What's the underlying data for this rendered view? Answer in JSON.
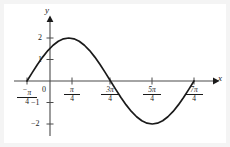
{
  "chart_data": {
    "type": "line",
    "title": "",
    "xlabel": "x",
    "ylabel": "y",
    "grid": false,
    "legend": null,
    "function": "y = 2 sin(x + pi/4)",
    "xlim": [
      -1.1781,
      6.0214
    ],
    "ylim": [
      -2.6,
      2.6
    ],
    "x_tick_labels": [
      "-π/4",
      "π/4",
      "3π/4",
      "5π/4",
      "7π/4"
    ],
    "x_tick_values": [
      -0.7854,
      0.7854,
      2.3562,
      3.927,
      5.4978
    ],
    "y_tick_labels": [
      "2",
      "1",
      "-1",
      "-2"
    ],
    "y_tick_values": [
      2,
      1,
      -1,
      -2
    ],
    "origin_label": "0",
    "x_points": [
      -0.7854,
      -0.589,
      -0.3927,
      -0.1963,
      0,
      0.1963,
      0.3927,
      0.589,
      0.7854,
      0.9817,
      1.1781,
      1.3744,
      1.5708,
      1.7671,
      1.9635,
      2.1598,
      2.3562,
      2.5525,
      2.7489,
      2.9452,
      3.1416,
      3.3379,
      3.5343,
      3.7306,
      3.927,
      4.1233,
      4.3197,
      4.516,
      4.7124,
      4.9087,
      5.1051,
      5.3014,
      5.4978
    ],
    "y_points": [
      0,
      0.3902,
      0.7654,
      1.1111,
      1.4142,
      1.6629,
      1.8478,
      1.9616,
      2,
      1.9616,
      1.8478,
      1.6629,
      1.4142,
      1.1111,
      0.7654,
      0.3902,
      0,
      -0.3902,
      -0.7654,
      -1.1111,
      -1.4142,
      -1.6629,
      -1.8478,
      -1.9616,
      -2,
      -1.9616,
      -1.8478,
      -1.6629,
      -1.4142,
      -1.1111,
      -0.7654,
      -0.3902,
      0
    ],
    "peak": {
      "x": 0.7854,
      "y": 2
    },
    "trough": {
      "x": 3.927,
      "y": -2
    },
    "zero_crossings": [
      -0.7854,
      2.3562,
      5.4978
    ],
    "curve_color": "#1a1a1a",
    "axis_color": "#4a4a4a",
    "background": "#f4f4f4"
  },
  "axes": {
    "y_name": "y",
    "x_name": "x"
  },
  "labels": {
    "y2": "2",
    "y1": "1",
    "ym1": "1",
    "ym2": "2",
    "minus1": "−",
    "minus2": "−",
    "zero": "0"
  },
  "xticks": [
    {
      "sign": "−",
      "num": "π",
      "den": "4"
    },
    {
      "sign": "",
      "num": "π",
      "den": "4"
    },
    {
      "sign": "",
      "num": "3π",
      "den": "4"
    },
    {
      "sign": "",
      "num": "5π",
      "den": "4"
    },
    {
      "sign": "",
      "num": "7π",
      "den": "4"
    }
  ]
}
